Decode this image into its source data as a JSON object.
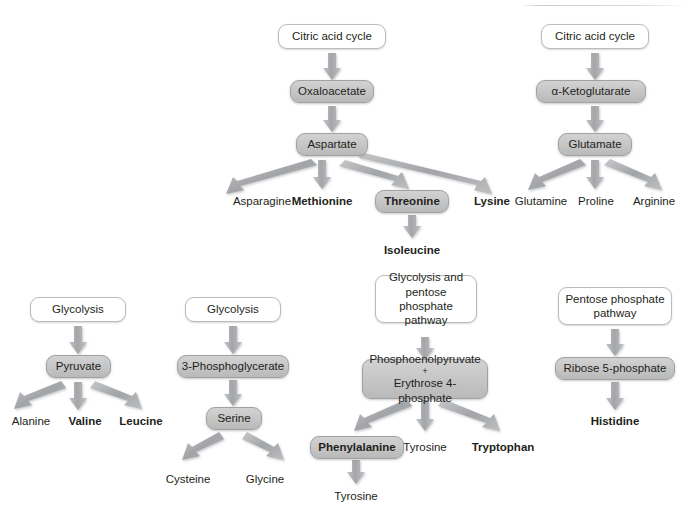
{
  "diagram": {
    "colors": {
      "box_gray_top": "#d2d2d2",
      "box_gray_bottom": "#b9b9b9",
      "box_border": "#9fa1a3",
      "white_box_border": "#b9bcbe",
      "arrow": "#a6a8ab",
      "text": "#231f20",
      "background": "#ffffff"
    },
    "groups": [
      {
        "id": "aspartate-family",
        "source": {
          "label": "Citric acid cycle",
          "style": "white"
        },
        "intermediates": [
          {
            "label": "Oxaloacetate",
            "style": "gray"
          },
          {
            "label": "Aspartate",
            "style": "gray"
          }
        ],
        "products": [
          {
            "label": "Asparagine",
            "bold": false,
            "boxed": false
          },
          {
            "label": "Methionine",
            "bold": true,
            "boxed": false
          },
          {
            "label": "Threonine",
            "bold": true,
            "boxed": true
          },
          {
            "label": "Lysine",
            "bold": true,
            "boxed": false
          }
        ],
        "secondary_products": [
          {
            "label": "Isoleucine",
            "bold": true,
            "from": "Threonine"
          }
        ]
      },
      {
        "id": "glutamate-family",
        "source": {
          "label": "Citric acid cycle",
          "style": "white"
        },
        "intermediates": [
          {
            "label": "α-Ketoglutarate",
            "style": "gray"
          },
          {
            "label": "Glutamate",
            "style": "gray"
          }
        ],
        "products": [
          {
            "label": "Glutamine",
            "bold": false,
            "boxed": false
          },
          {
            "label": "Proline",
            "bold": false,
            "boxed": false
          },
          {
            "label": "Arginine",
            "bold": false,
            "boxed": false
          }
        ],
        "secondary_products": []
      },
      {
        "id": "pyruvate-family",
        "source": {
          "label": "Glycolysis",
          "style": "white"
        },
        "intermediates": [
          {
            "label": "Pyruvate",
            "style": "gray"
          }
        ],
        "products": [
          {
            "label": "Alanine",
            "bold": false,
            "boxed": false
          },
          {
            "label": "Valine",
            "bold": true,
            "boxed": false
          },
          {
            "label": "Leucine",
            "bold": true,
            "boxed": false
          }
        ],
        "secondary_products": []
      },
      {
        "id": "serine-family",
        "source": {
          "label": "Glycolysis",
          "style": "white"
        },
        "intermediates": [
          {
            "label": "3-Phosphoglycerate",
            "style": "gray"
          },
          {
            "label": "Serine",
            "style": "gray"
          }
        ],
        "products": [
          {
            "label": "Cysteine",
            "bold": false,
            "boxed": false
          },
          {
            "label": "Glycine",
            "bold": false,
            "boxed": false
          }
        ],
        "secondary_products": []
      },
      {
        "id": "aromatic-family",
        "source": {
          "label": "Glycolysis and pentose phosphate pathway",
          "style": "white"
        },
        "intermediates": [
          {
            "label_line1": "Phosphoenolpyruvate",
            "label_plus": "+",
            "label_line2": "Erythrose 4-phosphate",
            "style": "gray"
          }
        ],
        "products": [
          {
            "label": "Phenylalanine",
            "bold": true,
            "boxed": true
          },
          {
            "label": "Tyrosine",
            "bold": false,
            "boxed": false
          },
          {
            "label": "Tryptophan",
            "bold": true,
            "boxed": false
          }
        ],
        "secondary_products": [
          {
            "label": "Tyrosine",
            "bold": false,
            "from": "Phenylalanine"
          }
        ]
      },
      {
        "id": "histidine-family",
        "source": {
          "label": "Pentose phosphate pathway",
          "style": "white"
        },
        "intermediates": [
          {
            "label": "Ribose 5-phosphate",
            "style": "gray"
          }
        ],
        "products": [
          {
            "label": "Histidine",
            "bold": true,
            "boxed": false
          }
        ],
        "secondary_products": []
      }
    ]
  }
}
